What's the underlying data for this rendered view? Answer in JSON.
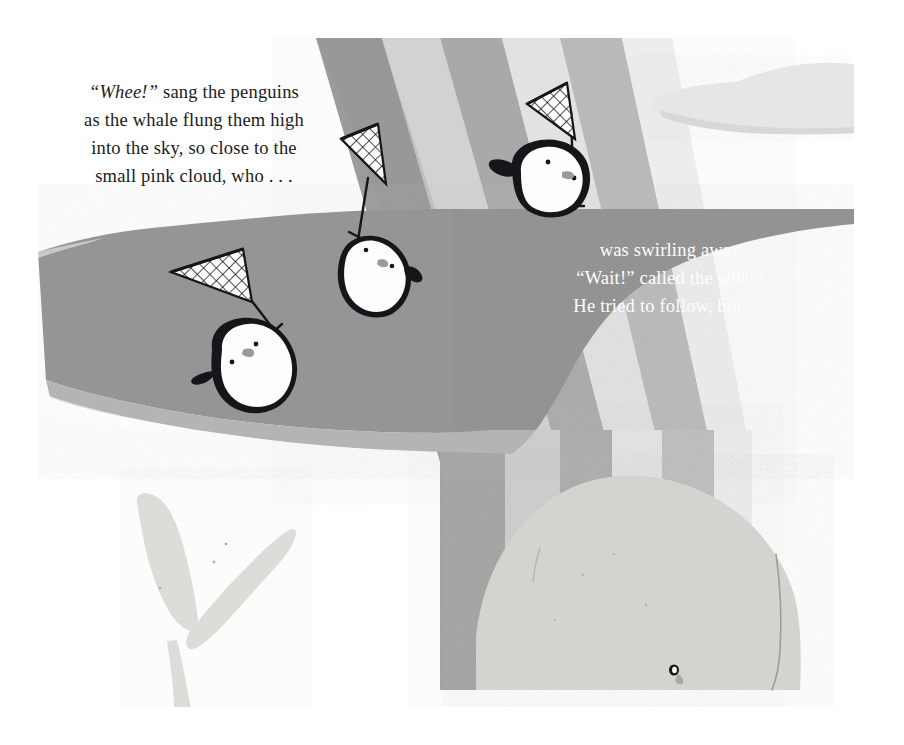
{
  "page": {
    "kind": "picture-book-illustration",
    "width": 904,
    "height": 745,
    "border_color": "#ffffff",
    "background_color": "#fefefe",
    "palette": {
      "paper_white": "#fdfdfd",
      "water_gray": "#949494",
      "water_light_edge": "#b4b4b4",
      "whale_body": "#d2d2cf",
      "whale_tail": "#dcdcd9",
      "cloud_gray": "#e3e3e1",
      "rainbow_darkest": "#8a8a8a",
      "rainbow_dark": "#9e9e9e",
      "rainbow_mid": "#b5b5b5",
      "rainbow_light": "#cccccc",
      "rainbow_lightest": "#e6e6e6",
      "ink_black": "#16161a",
      "penguin_belly": "#fdfdfd",
      "beak_gray": "#9a9a9a",
      "text_dark": "#1b1b1f",
      "text_light": "#fdfdfd"
    }
  },
  "left_text": {
    "name": "left-narration",
    "color": "#1b1b1f",
    "align": "center",
    "lines": [
      {
        "emphasis": "Whee!",
        "quoted": true,
        "rest": " sang the penguins"
      },
      {
        "emphasis": "",
        "quoted": false,
        "rest": "as the whale flung them high"
      },
      {
        "emphasis": "",
        "quoted": false,
        "rest": "into the sky, so close to the"
      },
      {
        "emphasis": "",
        "quoted": false,
        "rest": "small pink cloud, who . . ."
      }
    ],
    "line1_emphasis": "“Whee!”",
    "line1_rest": " sang the penguins",
    "line2": "as the whale flung them high",
    "line3": "into the sky, so close to the",
    "line4": "small pink cloud, who . . ."
  },
  "right_text": {
    "name": "right-narration",
    "color": "#fdfdfd",
    "align": "center",
    "line1": "was swirling away.",
    "line2": "“Wait!” called the whale.",
    "line3": "He tried to follow, but . . ."
  },
  "scene": {
    "description": "Three penguins holding butterfly nets fly through the air over a gray whale and water, against a striped rainbow arc.",
    "elements": [
      {
        "name": "whale",
        "label": "whale"
      },
      {
        "name": "whale-tail",
        "label": "whale tail"
      },
      {
        "name": "water-band",
        "label": "water"
      },
      {
        "name": "rainbow-bands",
        "label": "rainbow"
      },
      {
        "name": "cloud",
        "label": "small pink cloud"
      },
      {
        "name": "penguin-top",
        "label": "penguin"
      },
      {
        "name": "penguin-middle",
        "label": "penguin"
      },
      {
        "name": "penguin-bottom",
        "label": "penguin"
      },
      {
        "name": "net",
        "label": "butterfly net"
      }
    ],
    "penguin_count": 3,
    "net_count": 3,
    "whale_eye_position": {
      "x": 674,
      "y": 670
    }
  }
}
